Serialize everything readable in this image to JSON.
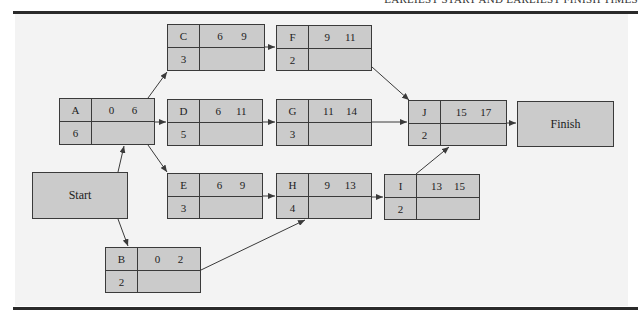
{
  "header": {
    "title": "EARLIEST START AND EARLIEST FINISH TIMES"
  },
  "terminals": {
    "start": {
      "label": "Start"
    },
    "finish": {
      "label": "Finish"
    }
  },
  "activities": [
    {
      "id": "A",
      "duration": "6",
      "es": "0",
      "ef": "6"
    },
    {
      "id": "B",
      "duration": "2",
      "es": "0",
      "ef": "2"
    },
    {
      "id": "C",
      "duration": "3",
      "es": "6",
      "ef": "9"
    },
    {
      "id": "D",
      "duration": "5",
      "es": "6",
      "ef": "11"
    },
    {
      "id": "E",
      "duration": "3",
      "es": "6",
      "ef": "9"
    },
    {
      "id": "F",
      "duration": "2",
      "es": "9",
      "ef": "11"
    },
    {
      "id": "G",
      "duration": "3",
      "es": "11",
      "ef": "14"
    },
    {
      "id": "H",
      "duration": "4",
      "es": "9",
      "ef": "13"
    },
    {
      "id": "I",
      "duration": "2",
      "es": "13",
      "ef": "15"
    },
    {
      "id": "J",
      "duration": "2",
      "es": "15",
      "ef": "17"
    }
  ],
  "edges": [
    [
      "Start",
      "A"
    ],
    [
      "Start",
      "B"
    ],
    [
      "A",
      "C"
    ],
    [
      "A",
      "D"
    ],
    [
      "A",
      "E"
    ],
    [
      "C",
      "F"
    ],
    [
      "D",
      "G"
    ],
    [
      "E",
      "H"
    ],
    [
      "B",
      "H"
    ],
    [
      "F",
      "J"
    ],
    [
      "G",
      "J"
    ],
    [
      "H",
      "I"
    ],
    [
      "I",
      "J"
    ],
    [
      "J",
      "Finish"
    ]
  ],
  "colors": {
    "node_fill": "#cbcbcb",
    "panel": "#f3f3f3",
    "stroke": "#3a3a3a"
  }
}
